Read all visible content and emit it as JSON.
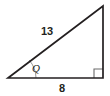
{
  "figure": {
    "type": "right-triangle",
    "background_color": "#ffffff",
    "stroke_color": "#231f20",
    "arc_color": "#8c8c8c",
    "text_color": "#231f20",
    "labels": {
      "hypotenuse": "13",
      "base": "8",
      "angle": "Q"
    },
    "geometry": {
      "left_vertex": [
        8,
        78
      ],
      "right_vertex": [
        103,
        78
      ],
      "top_vertex": [
        103,
        6
      ]
    },
    "markers": {
      "right_angle_marker": "right-angle-square",
      "angle_arc": "angle-arc"
    }
  }
}
